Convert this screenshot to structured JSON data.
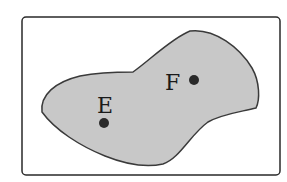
{
  "diagram": {
    "frame": {
      "x": 22,
      "y": 17,
      "width": 258,
      "height": 158,
      "radius": 4,
      "stroke": "#2a2a2a"
    },
    "region": {
      "fill": "#c8c8c8",
      "stroke": "#3a3a3a"
    },
    "points": [
      {
        "label": "E",
        "cx": 104,
        "cy": 123,
        "label_x": 97,
        "label_y": 113
      },
      {
        "label": "F",
        "cx": 194,
        "cy": 80,
        "label_x": 165,
        "label_y": 90
      }
    ]
  }
}
